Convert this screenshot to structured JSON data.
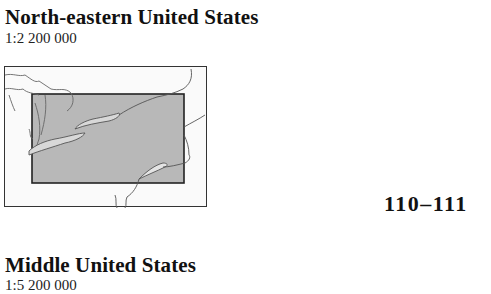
{
  "entries": [
    {
      "title": "North-eastern United States",
      "scale": "1:2 200 000",
      "pages": "110–111",
      "locator_map": {
        "icon": "locator-map-north-eastern-us",
        "frame_fill": "#fafafa",
        "highlight_fill": "#b5b5b5",
        "outline_color": "#333333"
      }
    },
    {
      "title": "Middle United States",
      "scale": "1:5 200 000"
    }
  ]
}
